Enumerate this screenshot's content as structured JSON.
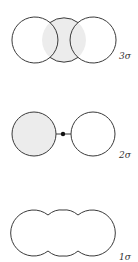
{
  "diagram": {
    "colors": {
      "stroke": "#3a3a3a",
      "shade": "#ececec",
      "background": "#ffffff"
    },
    "orbitals": [
      {
        "id": "3sigma",
        "label": "3σ",
        "description": "three overlapping circles, central overlap region shaded"
      },
      {
        "id": "2sigma",
        "label": "2σ",
        "description": "two separated circles joined by a dot, left circle shaded"
      },
      {
        "id": "1sigma",
        "label": "1σ",
        "description": "three merged lobes forming a single unshaded outline"
      }
    ]
  }
}
